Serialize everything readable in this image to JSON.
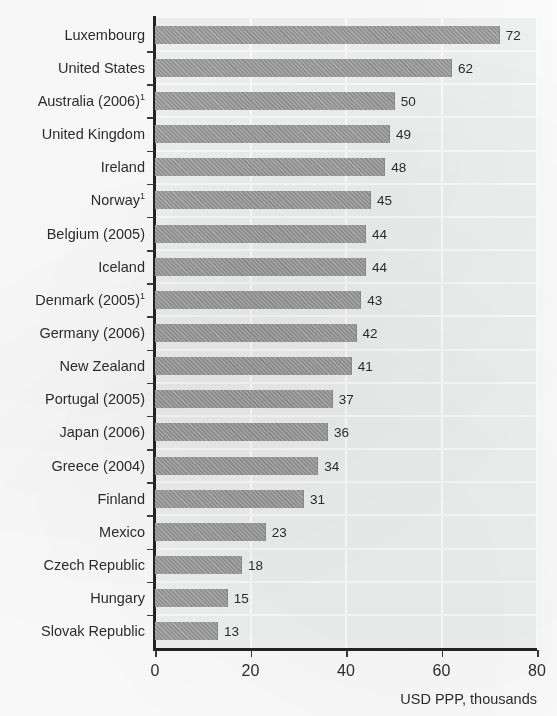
{
  "chart_data": {
    "type": "bar",
    "orientation": "horizontal",
    "title": "",
    "xlabel": "USD PPP, thousands",
    "ylabel": "",
    "xlim": [
      0,
      80
    ],
    "xticks": [
      "0",
      "20",
      "40",
      "60",
      "80"
    ],
    "xtick_values": [
      0,
      20,
      40,
      60,
      80
    ],
    "grid": true,
    "grid_axis": "x",
    "legend": false,
    "bar_color": "#9b9b9b",
    "plot_background": "#f1f2f2",
    "categories": [
      "Luxembourg",
      "United States",
      "Australia (2006)",
      "United Kingdom",
      "Ireland",
      "Norway",
      "Belgium (2005)",
      "Iceland",
      "Denmark (2005)",
      "Germany (2006)",
      "New Zealand",
      "Portugal (2005)",
      "Japan (2006)",
      "Greece (2004)",
      "Finland",
      "Mexico",
      "Czech Republic",
      "Hungary",
      "Slovak Republic"
    ],
    "category_footnotes": [
      "",
      "",
      "1",
      "",
      "",
      "1",
      "",
      "",
      "1",
      "",
      "",
      "",
      "",
      "",
      "",
      "",
      "",
      "",
      ""
    ],
    "values": [
      72,
      62,
      50,
      49,
      48,
      45,
      44,
      44,
      43,
      42,
      41,
      37,
      36,
      34,
      31,
      23,
      18,
      15,
      13
    ],
    "value_labels": [
      "72",
      "62",
      "50",
      "49",
      "48",
      "45",
      "44",
      "44",
      "43",
      "42",
      "41",
      "37",
      "36",
      "34",
      "31",
      "23",
      "18",
      "15",
      "13"
    ]
  },
  "axis_caption": "USD PPP, thousands"
}
